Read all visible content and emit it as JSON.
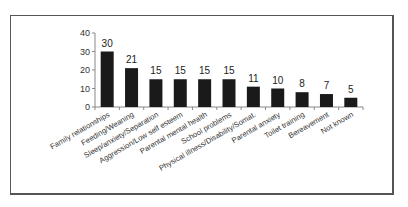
{
  "chart_data": {
    "type": "bar",
    "title": "",
    "xlabel": "",
    "ylabel": "",
    "ylim": [
      0,
      40
    ],
    "yticks": [
      0,
      10,
      20,
      30,
      40
    ],
    "grid": false,
    "legend": null,
    "bar_color": "#1a1a1a",
    "categories": [
      "Family relationships",
      "Feeding/Weaning",
      "Sleep/anxiety/Separation",
      "Aggression/Low self esteem",
      "Parental mental health",
      "School problems",
      "Physical illness/Disability/Somat.",
      "Parental anxiety",
      "Toilet training",
      "Bereavement",
      "Not known"
    ],
    "values": [
      30,
      21,
      15,
      15,
      15,
      15,
      11,
      10,
      8,
      7,
      5
    ],
    "data_labels": [
      "30",
      "21",
      "15",
      "15",
      "15",
      "15",
      "11",
      "10",
      "8",
      "7",
      "5"
    ]
  }
}
